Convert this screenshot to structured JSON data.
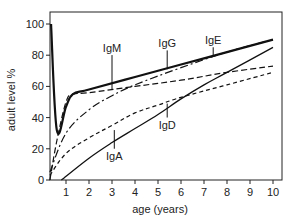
{
  "chart_data": {
    "type": "line",
    "title": "",
    "xlabel": "age (years)",
    "ylabel": "adult level %",
    "xlim": [
      0.3,
      10.4
    ],
    "ylim": [
      0,
      100
    ],
    "xticks": [
      1,
      2,
      3,
      4,
      5,
      6,
      7,
      8,
      9,
      10
    ],
    "yticks": [
      0,
      20,
      40,
      60,
      80,
      100
    ],
    "grid": false,
    "legend": "inline labels with leader lines",
    "series": [
      {
        "name": "IgG",
        "style": "thick-solid",
        "x": [
          0.35,
          0.6,
          1.0,
          1.3,
          2,
          4,
          6,
          8,
          10
        ],
        "y": [
          100,
          32,
          47,
          55,
          58,
          66,
          74,
          82,
          90
        ],
        "label_pos": {
          "x": 5.4,
          "y": 85
        },
        "leader_to": {
          "x": 5.4,
          "y": 71
        }
      },
      {
        "name": "IgM",
        "style": "long-dash",
        "x": [
          0.3,
          0.6,
          1.0,
          1.3,
          2,
          4,
          6,
          8,
          10
        ],
        "y": [
          0,
          25,
          50,
          55,
          56,
          60,
          64,
          69,
          73
        ],
        "label_pos": {
          "x": 3.0,
          "y": 82
        },
        "leader_to": {
          "x": 3.0,
          "y": 58
        }
      },
      {
        "name": "IgE",
        "style": "dash-dot",
        "x": [
          0.3,
          1,
          2,
          3,
          4,
          6,
          8,
          10
        ],
        "y": [
          5,
          30,
          45,
          54,
          61,
          72,
          82,
          90
        ],
        "label_pos": {
          "x": 7.4,
          "y": 87
        },
        "leader_to": {
          "x": 7.4,
          "y": 80
        }
      },
      {
        "name": "IgA",
        "style": "thin-solid",
        "x": [
          0.8,
          2,
          3,
          4,
          5,
          6,
          7,
          8,
          10
        ],
        "y": [
          0,
          14,
          24,
          33,
          42,
          52,
          61,
          69,
          85
        ],
        "label_pos": {
          "x": 3.1,
          "y": 13
        },
        "leader_to": {
          "x": 3.1,
          "y": 32
        }
      },
      {
        "name": "IgD",
        "style": "short-dash",
        "x": [
          0.3,
          1,
          2,
          3,
          4,
          5,
          6,
          8,
          10
        ],
        "y": [
          3,
          17,
          27,
          35,
          43,
          48,
          53,
          61,
          69
        ],
        "label_pos": {
          "x": 5.4,
          "y": 33
        },
        "leader_to": {
          "x": 5.4,
          "y": 49
        }
      }
    ]
  }
}
